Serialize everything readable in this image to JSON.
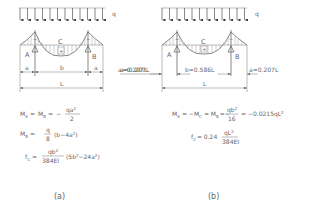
{
  "diagram": {
    "load_label": "q",
    "panels": [
      {
        "id": "a",
        "caption": "(a)",
        "labels": {
          "mid": "C",
          "left_support": "A",
          "right_support": "B"
        },
        "dimensions": {
          "left": "a",
          "middle": "b",
          "right": "a",
          "total": "L",
          "note": "a=0.207L"
        },
        "formulas": {
          "moment_supports": {
            "lhs": "M",
            "lhs_sub1": "A",
            "eq": "=",
            "mid": "M",
            "mid_sub": "B",
            "eq2": "=",
            "sign": "−",
            "num": "qa",
            "num_sup": "2",
            "den": "2"
          },
          "moment_mid": {
            "lhs": "M",
            "lhs_sub": "B",
            "eq": "=",
            "num": "q",
            "den": "8",
            "tail": "(b−4a",
            "tail_sup": "2",
            "tail_end": ")"
          },
          "deflection": {
            "lhs": "f",
            "lhs_sub": "C",
            "eq": "=",
            "num": "qb",
            "num_sup": "2",
            "den": "384EI",
            "tail": "(5b",
            "tail_sup1": "2",
            "tail_mid": "−24a",
            "tail_sup2": "2",
            "tail_end": ")"
          }
        }
      },
      {
        "id": "b",
        "caption": "(b)",
        "labels": {
          "mid": "C",
          "left_support": "A",
          "right_support": "B"
        },
        "dimensions": {
          "left": "a=0.207L",
          "middle": "b=0.586L",
          "right": "a=0.207L",
          "total": "L"
        },
        "formulas": {
          "moment": {
            "text1": "M",
            "sub1": "A",
            "text2": "= −M",
            "sub2": "C",
            "text3": "= M",
            "sub3": "B",
            "text4": "=−",
            "num": "qb",
            "num_sup": "2",
            "den": "16",
            "text5": "= −0.0215qL",
            "sup5": "2"
          },
          "deflection": {
            "lhs": "f",
            "lhs_sub": "C",
            "eq": "= 0.24",
            "num": "qL",
            "num_sup": "2",
            "den": "384EI"
          }
        }
      }
    ]
  }
}
